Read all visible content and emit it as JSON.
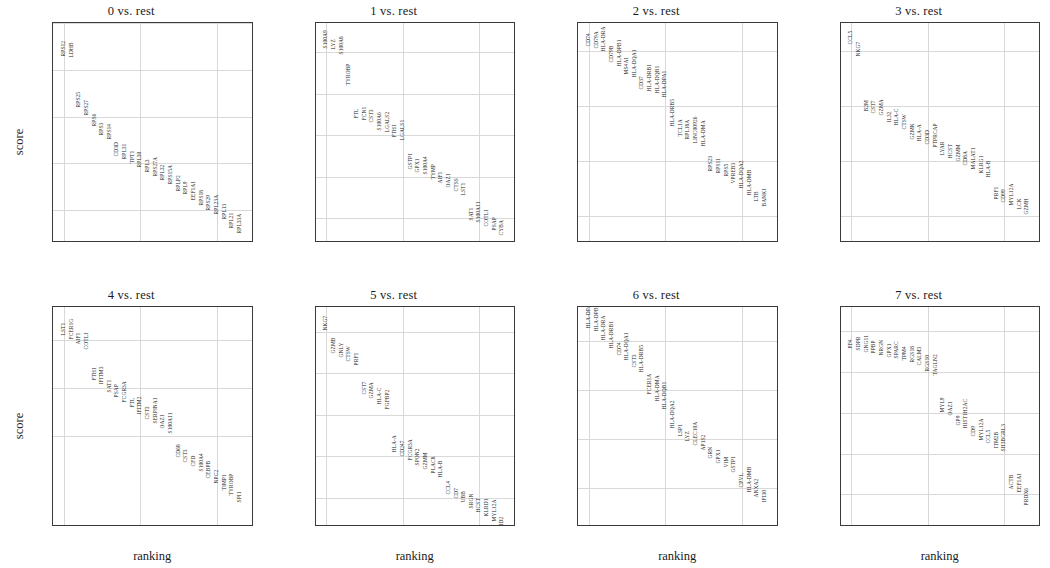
{
  "figure": {
    "ylabel": "score",
    "xlabel": "ranking",
    "panel_count": 8
  },
  "chart_data": [
    {
      "type": "scatter",
      "title": "0 vs. rest",
      "xlabel": "ranking",
      "ylabel": "score",
      "xlim": [
        -1.4,
        24.8
      ],
      "ylim": [
        24.6,
        34.0
      ],
      "xticks": [
        0,
        10,
        20
      ],
      "yticks": [
        26,
        28,
        30,
        32,
        34
      ],
      "grid": true,
      "x": [
        0,
        1,
        2,
        3,
        4,
        5,
        6,
        7,
        8,
        9,
        10,
        11,
        12,
        13,
        14,
        15,
        16,
        17,
        18,
        19,
        20,
        21,
        22,
        23
      ],
      "labels": [
        "RPS12",
        "LDHB",
        "RPS25",
        "RPS27",
        "RPS6",
        "RPS3",
        "RPS14",
        "CD3D",
        "RPL31",
        "TPT1",
        "RPL30",
        "RPL3",
        "RPS27A",
        "RPL32",
        "RPS15A",
        "RPLP2",
        "RPL9",
        "EEF1A1",
        "RPS18",
        "RPS29",
        "RPL23A",
        "RPL13",
        "RPL21",
        "RPL33A"
      ],
      "values": [
        32.75,
        32.72,
        30.6,
        30.25,
        29.75,
        29.4,
        29.2,
        28.5,
        28.35,
        28.2,
        28.0,
        27.8,
        27.65,
        27.45,
        27.3,
        27.0,
        26.85,
        26.6,
        26.4,
        26.2,
        26.0,
        25.8,
        25.4,
        25.2
      ]
    },
    {
      "type": "scatter",
      "title": "1 vs. rest",
      "xlabel": "ranking",
      "ylabel": "score",
      "xlim": [
        -1.4,
        24.8
      ],
      "ylim": [
        24.8,
        35.4
      ],
      "xticks": [
        0,
        10,
        20
      ],
      "yticks": [
        26,
        28,
        30,
        32,
        34
      ],
      "grid": true,
      "x": [
        0,
        1,
        2,
        3,
        4,
        5,
        6,
        7,
        8,
        9,
        10,
        11,
        12,
        13,
        14,
        15,
        16,
        17,
        18,
        19,
        20,
        21,
        22,
        23
      ],
      "labels": [
        "S100A9",
        "LYZ",
        "S100A8",
        "TYROBP",
        "FTL",
        "FCN1",
        "CST3",
        "S100A6",
        "LGALS2",
        "FTH1",
        "LGALS1",
        "GSTP1",
        "GPX1",
        "S100A4",
        "TYMP",
        "AIF1",
        "OAZ1",
        "CTSS",
        "LST1",
        "SAT1",
        "S100A11",
        "COTL1",
        "PSAP",
        "CYBA"
      ],
      "values": [
        34.4,
        34.35,
        34.1,
        32.6,
        31.0,
        30.9,
        30.8,
        30.45,
        30.35,
        30.1,
        29.95,
        28.55,
        28.4,
        28.3,
        28.1,
        27.9,
        27.7,
        27.5,
        27.3,
        26.1,
        26.0,
        25.8,
        25.6,
        25.4
      ]
    },
    {
      "type": "scatter",
      "title": "2 vs. rest",
      "xlabel": "ranking",
      "ylabel": "score",
      "xlim": [
        -1.4,
        24.8
      ],
      "ylim": [
        12.5,
        32.5
      ],
      "xticks": [
        0,
        10,
        20
      ],
      "yticks": [
        15,
        20,
        25,
        30
      ],
      "grid": true,
      "x": [
        0,
        1,
        2,
        3,
        4,
        5,
        6,
        7,
        8,
        9,
        10,
        11,
        12,
        13,
        14,
        15,
        16,
        17,
        18,
        19,
        20,
        21,
        22,
        23
      ],
      "labels": [
        "CD74",
        "CD79A",
        "HLA-DRA",
        "CD79B",
        "HLA-DPB1",
        "MS4A1",
        "HLA-DQA1",
        "CD37",
        "HLA-DRB1",
        "HLA-DQB1",
        "HLA-DPA1",
        "HLA-DRB5",
        "TCL1A",
        "RPL18A",
        "LINC00926",
        "HLA-DMA",
        "RPS23",
        "RPS11",
        "RPS5",
        "VPREB3",
        "HLA-DQA2",
        "HLA-DMB",
        "LTB",
        "BANK1"
      ],
      "values": [
        30.8,
        30.6,
        30.3,
        29.3,
        29.0,
        28.2,
        28.0,
        26.9,
        26.7,
        26.5,
        26.1,
        23.5,
        22.6,
        22.3,
        22.0,
        21.7,
        19.4,
        19.2,
        19.0,
        18.3,
        17.9,
        17.2,
        16.7,
        16.2
      ]
    },
    {
      "type": "scatter",
      "title": "3 vs. rest",
      "xlabel": "ranking",
      "ylabel": "score",
      "xlim": [
        -1.4,
        24.8
      ],
      "ylim": [
        7.5,
        27.5
      ],
      "xticks": [
        0,
        10,
        20
      ],
      "yticks": [
        10,
        15,
        20,
        25
      ],
      "grid": true,
      "x": [
        0,
        1,
        2,
        3,
        4,
        5,
        6,
        7,
        8,
        9,
        10,
        11,
        12,
        13,
        14,
        15,
        16,
        17,
        18,
        19,
        20,
        21,
        22,
        23
      ],
      "labels": [
        "CCL5",
        "NKG7",
        "B2M",
        "CST7",
        "GZMA",
        "IL32",
        "HLA-C",
        "CTSW",
        "GZMK",
        "HLA-A",
        "CD3D",
        "PTPRCAP",
        "LYAR",
        "HCST",
        "GZMM",
        "CD8A",
        "MALAT1",
        "KLRG1",
        "HLA-B",
        "PRF1",
        "CD99",
        "MYL12A",
        "LCK",
        "GZMH"
      ],
      "values": [
        26.0,
        24.9,
        19.9,
        19.7,
        19.5,
        18.9,
        18.6,
        18.2,
        17.3,
        17.1,
        16.9,
        16.6,
        15.9,
        15.6,
        15.3,
        15.0,
        14.6,
        14.2,
        13.9,
        11.9,
        11.6,
        11.3,
        11.0,
        10.5
      ]
    },
    {
      "type": "scatter",
      "title": "4 vs. rest",
      "xlabel": "ranking",
      "ylabel": "score",
      "xlim": [
        -1.4,
        24.8
      ],
      "ylim": [
        14.2,
        23.4
      ],
      "xticks": [
        0,
        10,
        20
      ],
      "yticks": [
        18,
        20,
        22
      ],
      "grid": true,
      "x": [
        0,
        1,
        2,
        3,
        4,
        5,
        6,
        7,
        8,
        9,
        10,
        11,
        12,
        13,
        14,
        15,
        16,
        17,
        18,
        19,
        20,
        21,
        22,
        23
      ],
      "labels": [
        "LST1",
        "FCER1G",
        "AIF1",
        "COTL1",
        "FTH1",
        "IFITM3",
        "SAT1",
        "PSAP",
        "FCGR3A",
        "FTL",
        "IFITM2",
        "CST3",
        "SERPINA1",
        "OAZ1",
        "S100A11",
        "CD68",
        "CST3",
        "CFD",
        "S100A4",
        "CEBPB",
        "NPC2",
        "TIMP1",
        "TYROBP",
        "SPI1"
      ],
      "values": [
        22.4,
        22.25,
        22.0,
        21.8,
        20.5,
        20.35,
        20.0,
        19.8,
        19.6,
        19.4,
        19.1,
        18.9,
        18.7,
        18.5,
        18.3,
        17.3,
        17.1,
        16.9,
        16.7,
        16.4,
        16.2,
        15.9,
        15.7,
        15.4
      ]
    },
    {
      "type": "scatter",
      "title": "5 vs. rest",
      "xlabel": "ranking",
      "ylabel": "score",
      "xlim": [
        -1.4,
        24.8
      ],
      "ylim": [
        12.6,
        23.2
      ],
      "xticks": [
        0,
        10,
        20
      ],
      "yticks": [
        14,
        16,
        18,
        20,
        22
      ],
      "grid": true,
      "x": [
        0,
        1,
        2,
        3,
        4,
        5,
        6,
        7,
        8,
        9,
        10,
        11,
        12,
        13,
        14,
        15,
        16,
        17,
        18,
        19,
        20,
        21,
        22,
        23
      ],
      "labels": [
        "NKG7",
        "GZMB",
        "GNLY",
        "CTSW",
        "PRF1",
        "CST7",
        "GZMA",
        "HLA-C",
        "FGFBP2",
        "HLA-A",
        "CD247",
        "FCGR3A",
        "SPON2",
        "GZMM",
        "PLAC8",
        "HLA-B",
        "CCL4",
        "CD7",
        "UBB",
        "SRGN",
        "HCST",
        "KLRD1",
        "MYL12A",
        "ID2"
      ],
      "values": [
        22.3,
        21.2,
        21.0,
        20.8,
        20.6,
        19.2,
        19.0,
        18.7,
        18.5,
        16.4,
        16.2,
        16.0,
        15.8,
        15.6,
        15.4,
        15.2,
        14.4,
        14.2,
        14.0,
        13.7,
        13.5,
        13.3,
        13.1,
        12.9
      ]
    },
    {
      "type": "scatter",
      "title": "6 vs. rest",
      "xlabel": "ranking",
      "ylabel": "score",
      "xlim": [
        -1.4,
        24.8
      ],
      "ylim": [
        6.2,
        10.7
      ],
      "xticks": [
        0,
        10,
        20
      ],
      "yticks": [
        7,
        8,
        9,
        10
      ],
      "grid": true,
      "x": [
        0,
        1,
        2,
        3,
        4,
        5,
        6,
        7,
        8,
        9,
        10,
        11,
        12,
        13,
        14,
        15,
        16,
        17,
        18,
        19,
        20,
        21,
        22,
        23
      ],
      "labels": [
        "HLA-DPA1",
        "HLA-DPB1",
        "HLA-DRA",
        "HLA-DRB1",
        "CD74",
        "HLA-DQA1",
        "CST3",
        "HLA-DRB5",
        "FCER1A",
        "HLA-DMA",
        "HLA-DQB1",
        "HLA-DQA2",
        "LSP1",
        "LYZ",
        "CLEC10A",
        "AP1S2",
        "GRN",
        "GPX1",
        "VIM",
        "GSTP1",
        "CPVL",
        "HLA-DMB",
        "ANXA2",
        "IFI30"
      ],
      "values": [
        10.35,
        10.3,
        10.1,
        9.95,
        9.8,
        9.7,
        9.55,
        9.45,
        9.0,
        8.85,
        8.7,
        8.3,
        8.15,
        8.05,
        7.95,
        7.85,
        7.7,
        7.6,
        7.5,
        7.4,
        7.1,
        7.0,
        6.9,
        6.8
      ]
    },
    {
      "type": "scatter",
      "title": "7 vs. rest",
      "xlabel": "ranking",
      "ylabel": "score",
      "xlim": [
        -1.4,
        24.8
      ],
      "ylim": [
        5.3,
        6.65
      ],
      "xticks": [
        0,
        10,
        20
      ],
      "yticks": [
        5.5,
        5.75,
        6.0,
        6.25,
        6.5
      ],
      "ytick_labels": [
        "5.50",
        "5.75",
        "6.00",
        "6.25",
        "6.50"
      ],
      "grid": true,
      "x": [
        0,
        1,
        2,
        3,
        4,
        5,
        6,
        7,
        8,
        9,
        10,
        11,
        12,
        13,
        14,
        15,
        16,
        17,
        18,
        19,
        20,
        21,
        22,
        23
      ],
      "labels": [
        "PF4",
        "SDPR",
        "GNG11",
        "PPBP",
        "NRGN",
        "GPX1",
        "SPARC",
        "TPM4",
        "RGS18",
        "CALM3",
        "RGS10",
        "TAGLN2",
        "MYL9",
        "OAZ1",
        "GP9",
        "HIST1H2AC",
        "CD9",
        "MYL12A",
        "CCL5",
        "ITM2B",
        "SH3BGRL3",
        "ACTB",
        "EEF1A1",
        "PRDX6"
      ],
      "values": [
        6.42,
        6.41,
        6.4,
        6.39,
        6.38,
        6.37,
        6.36,
        6.35,
        6.34,
        6.32,
        6.28,
        6.26,
        6.03,
        6.01,
        5.95,
        5.93,
        5.88,
        5.86,
        5.84,
        5.81,
        5.79,
        5.56,
        5.54,
        5.46
      ]
    }
  ]
}
